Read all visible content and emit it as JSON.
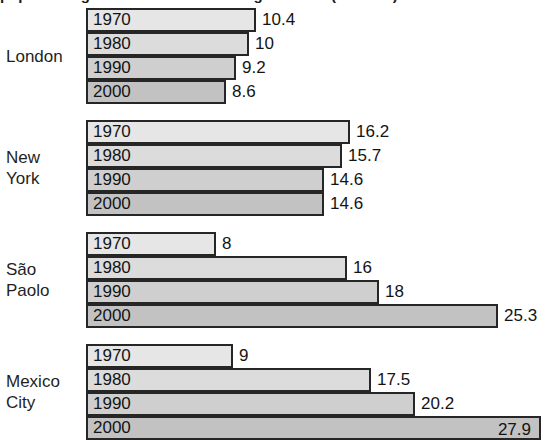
{
  "title": "population growth in the world's largest cities (millions)",
  "chart_data": {
    "type": "bar",
    "title": "population growth in the world's largest cities (millions)",
    "orientation": "horizontal",
    "xlabel": "",
    "ylabel": "",
    "grid": false,
    "legend": "none",
    "xlim": [
      0,
      28.6
    ],
    "categories": [
      "London",
      "New York",
      "São Paolo",
      "Mexico City"
    ],
    "series": [
      {
        "name": "1970",
        "values": [
          10.4,
          16.2,
          8,
          9
        ]
      },
      {
        "name": "1980",
        "values": [
          10,
          15.7,
          16,
          17.5
        ]
      },
      {
        "name": "1990",
        "values": [
          9.2,
          14.6,
          18,
          20.2
        ]
      },
      {
        "name": "2000",
        "values": [
          8.6,
          14.6,
          25.3,
          27.9
        ]
      }
    ],
    "value_labels": [
      [
        "10.4",
        "10",
        "9.2",
        "8.6"
      ],
      [
        "16.2",
        "15.7",
        "14.6",
        "14.6"
      ],
      [
        "8",
        "16",
        "18",
        "25.3"
      ],
      [
        "9",
        "17.5",
        "20.2",
        "27.9"
      ]
    ],
    "colors": {
      "1970": "#e6e6e6",
      "1980": "#dcdcdc",
      "1990": "#cfcfcf",
      "2000": "#c2c2c2",
      "bar_border": "#262626",
      "background": "#ffffff",
      "text": "#141414"
    }
  },
  "groups": [
    {
      "label": "London",
      "rows": [
        {
          "year": "1970",
          "value": 10.4,
          "value_label": "10.4",
          "label_inside": false
        },
        {
          "year": "1980",
          "value": 10,
          "value_label": "10",
          "label_inside": false
        },
        {
          "year": "1990",
          "value": 9.2,
          "value_label": "9.2",
          "label_inside": false
        },
        {
          "year": "2000",
          "value": 8.6,
          "value_label": "8.6",
          "label_inside": false
        }
      ]
    },
    {
      "label": "New\nYork",
      "rows": [
        {
          "year": "1970",
          "value": 16.2,
          "value_label": "16.2",
          "label_inside": false
        },
        {
          "year": "1980",
          "value": 15.7,
          "value_label": "15.7",
          "label_inside": false
        },
        {
          "year": "1990",
          "value": 14.6,
          "value_label": "14.6",
          "label_inside": false
        },
        {
          "year": "2000",
          "value": 14.6,
          "value_label": "14.6",
          "label_inside": false
        }
      ]
    },
    {
      "label": "São\nPaolo",
      "rows": [
        {
          "year": "1970",
          "value": 8,
          "value_label": "8",
          "label_inside": false
        },
        {
          "year": "1980",
          "value": 16,
          "value_label": "16",
          "label_inside": false
        },
        {
          "year": "1990",
          "value": 18,
          "value_label": "18",
          "label_inside": false
        },
        {
          "year": "2000",
          "value": 25.3,
          "value_label": "25.3",
          "label_inside": false
        }
      ]
    },
    {
      "label": "Mexico\nCity",
      "rows": [
        {
          "year": "1970",
          "value": 9,
          "value_label": "9",
          "label_inside": false
        },
        {
          "year": "1980",
          "value": 17.5,
          "value_label": "17.5",
          "label_inside": false
        },
        {
          "year": "1990",
          "value": 20.2,
          "value_label": "20.2",
          "label_inside": false
        },
        {
          "year": "2000",
          "value": 27.9,
          "value_label": "27.9",
          "label_inside": true
        }
      ]
    }
  ]
}
